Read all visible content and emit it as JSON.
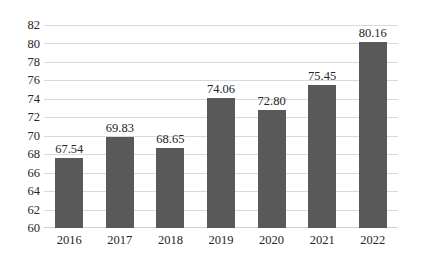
{
  "chart_data": {
    "type": "bar",
    "title": "",
    "subtitle": "",
    "xlabel": "",
    "ylabel": "",
    "categories": [
      "2016",
      "2017",
      "2018",
      "2019",
      "2020",
      "2021",
      "2022"
    ],
    "values": [
      67.54,
      69.83,
      68.65,
      74.06,
      72.8,
      75.45,
      80.16
    ],
    "data_labels": [
      "67.54",
      "69.83",
      "68.65",
      "74.06",
      "72.80",
      "75.45",
      "80.16"
    ],
    "ylim": [
      60,
      82
    ],
    "ytick_step": 2,
    "ytick_labels": [
      "82",
      "80",
      "78",
      "76",
      "74",
      "72",
      "70",
      "68",
      "66",
      "64",
      "62",
      "60"
    ],
    "ytick_values": [
      82,
      80,
      78,
      76,
      74,
      72,
      70,
      68,
      66,
      64,
      62,
      60
    ],
    "grid": true,
    "grid_axis": "y",
    "legend": false,
    "legend_position": "none",
    "series": [
      {
        "name": "",
        "values": [
          67.54,
          69.83,
          68.65,
          74.06,
          72.8,
          75.45,
          80.16
        ],
        "color": "#595959"
      }
    ],
    "colors": {
      "bar": "#595959",
      "gridline": "#d9d9d9",
      "text": "#262626",
      "background": "#ffffff"
    }
  }
}
